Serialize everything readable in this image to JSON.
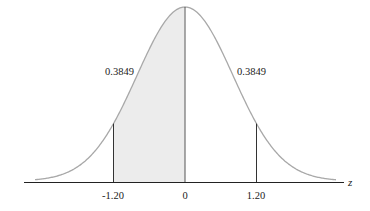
{
  "chart_data": {
    "type": "area",
    "title": "",
    "distribution": "standard normal",
    "xlabel": "z",
    "ylabel": "",
    "x_ticks": [
      {
        "value": -1.2,
        "label": "-1.20"
      },
      {
        "value": 0,
        "label": "0"
      },
      {
        "value": 1.2,
        "label": "1.20"
      }
    ],
    "shaded_region": {
      "from": -1.2,
      "to": 0,
      "area": 0.3849
    },
    "annotations": [
      {
        "label": "0.3849",
        "region": "between -1.20 and 0 (shaded)",
        "side": "left"
      },
      {
        "label": "0.3849",
        "region": "between 0 and 1.20 (unshaded)",
        "side": "right"
      }
    ],
    "vertical_lines_at": [
      -1.2,
      0,
      1.2
    ],
    "grid": false,
    "legend": null,
    "colors": {
      "curve": "#a8a8a8",
      "shade": "#ececec",
      "axis": "#222222",
      "lines": "#333333"
    }
  },
  "labels": {
    "axis_var": "z",
    "tick_neg": "-1.20",
    "tick_zero": "0",
    "tick_pos": "1.20",
    "area_left": "0.3849",
    "area_right": "0.3849"
  }
}
